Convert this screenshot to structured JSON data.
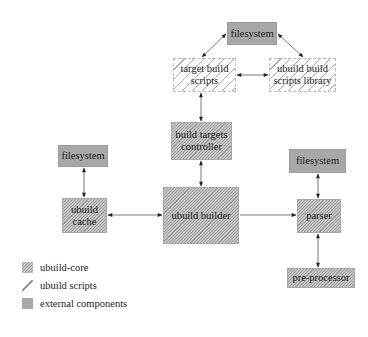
{
  "diagram": {
    "nodes": {
      "filesystem_top": {
        "label": "filesystem",
        "type": "external"
      },
      "target_build_scripts": {
        "label": "target build scripts",
        "line1": "target build",
        "line2": "scripts",
        "type": "scripts"
      },
      "ubuild_build_scripts_library": {
        "label": "ubuild build scripts library",
        "line1": "ubuild build",
        "line2": "scripts library",
        "type": "scripts"
      },
      "build_targets_controller": {
        "label": "build targets controller",
        "line1": "build targets",
        "line2": "controller",
        "type": "core"
      },
      "filesystem_left": {
        "label": "filesystem",
        "type": "external"
      },
      "ubuild_cache": {
        "label": "ubuild cache",
        "line1": "ubuild",
        "line2": "cache",
        "type": "core"
      },
      "ubuild_builder": {
        "label": "ubuild builder",
        "type": "core"
      },
      "filesystem_right": {
        "label": "filesystem",
        "type": "external"
      },
      "parser": {
        "label": "parser",
        "type": "core"
      },
      "pre_processor": {
        "label": "pre-processor",
        "type": "core"
      }
    },
    "edges": [
      {
        "from": "filesystem_top",
        "to": "target_build_scripts",
        "direction": "both"
      },
      {
        "from": "filesystem_top",
        "to": "ubuild_build_scripts_library",
        "direction": "both"
      },
      {
        "from": "target_build_scripts",
        "to": "ubuild_build_scripts_library",
        "direction": "both"
      },
      {
        "from": "target_build_scripts",
        "to": "build_targets_controller",
        "direction": "both"
      },
      {
        "from": "build_targets_controller",
        "to": "ubuild_builder",
        "direction": "both"
      },
      {
        "from": "filesystem_left",
        "to": "ubuild_cache",
        "direction": "both"
      },
      {
        "from": "ubuild_cache",
        "to": "ubuild_builder",
        "direction": "both"
      },
      {
        "from": "ubuild_builder",
        "to": "parser",
        "direction": "forward"
      },
      {
        "from": "filesystem_right",
        "to": "parser",
        "direction": "both"
      },
      {
        "from": "parser",
        "to": "pre_processor",
        "direction": "both"
      }
    ],
    "colors": {
      "external": "#a8a8a8",
      "core": "#c4c4c4",
      "scripts_hatch": "#969696",
      "arrow": "#333333"
    }
  },
  "legend": {
    "items": [
      {
        "label": "ubuild-core",
        "type": "core"
      },
      {
        "label": "ubuild scripts",
        "type": "scripts"
      },
      {
        "label": "external components",
        "type": "external"
      }
    ]
  }
}
